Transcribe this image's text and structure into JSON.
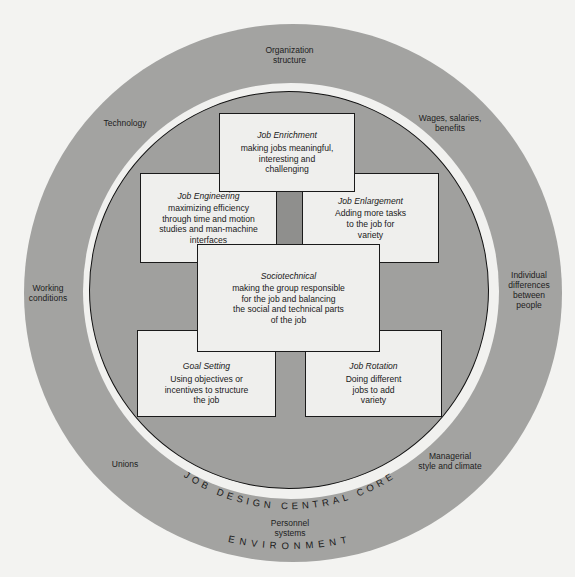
{
  "diagram": {
    "environment": {
      "label": "ENVIRONMENT",
      "factors": [
        {
          "id": "organization-structure",
          "text": "Organization\nstructure"
        },
        {
          "id": "technology",
          "text": "Technology"
        },
        {
          "id": "wages",
          "text": "Wages, salaries,\nbenefits"
        },
        {
          "id": "working-conditions",
          "text": "Working\nconditions"
        },
        {
          "id": "individual-differences",
          "text": "Individual\ndifferences\nbetween\npeople"
        },
        {
          "id": "unions",
          "text": "Unions"
        },
        {
          "id": "managerial-style",
          "text": "Managerial\nstyle and climate"
        },
        {
          "id": "personnel-systems",
          "text": "Personnel\nsystems"
        }
      ]
    },
    "core": {
      "label": "JOB DESIGN CENTRAL CORE",
      "boxes": [
        {
          "id": "job-enrichment",
          "title": "Job Enrichment",
          "desc": "making jobs meaningful,\ninteresting and\nchallenging"
        },
        {
          "id": "job-engineering",
          "title": "Job Engineering",
          "desc": "maximizing efficiency\nthrough time and motion\nstudies and man-machine\ninterfaces"
        },
        {
          "id": "job-enlargement",
          "title": "Job Enlargement",
          "desc": "Adding more tasks\nto the job  for\nvariety"
        },
        {
          "id": "sociotechnical",
          "title": "Sociotechnical",
          "desc": "making the group responsible\nfor the job and balancing\nthe social and technical parts\nof the job"
        },
        {
          "id": "goal-setting",
          "title": "Goal Setting",
          "desc": "Using objectives or\nincentives to structure\nthe job"
        },
        {
          "id": "job-rotation",
          "title": "Job Rotation",
          "desc": "Doing different\njobs to add\nvariety"
        }
      ]
    },
    "colors": {
      "background": "#f3f3f1",
      "environment_ring": "#a3a3a1",
      "separator_ring": "#f1f1ef",
      "core_fill": "#a0a09e",
      "box_fill": "#efefed",
      "outline": "#1a1a1a"
    }
  }
}
